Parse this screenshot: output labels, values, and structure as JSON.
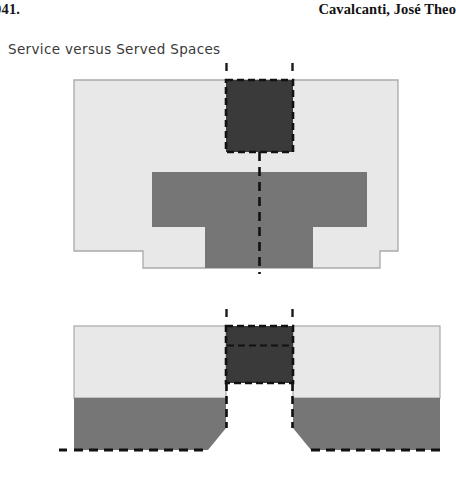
{
  "page": {
    "background_color": "#ffffff",
    "width": 454,
    "height": 496
  },
  "running_head": {
    "left_text": "041.",
    "right_text": "Cavalcanti, José Theo"
  },
  "figure": {
    "caption": "Service versus Served Spaces",
    "palette": {
      "light_gray": "#e8e8e8",
      "mid_gray": "#767676",
      "dark_gray": "#3a3a3a",
      "outline": "#9a9a9a",
      "dash_color": "#111111",
      "paper": "#ffffff"
    },
    "diagrams": [
      {
        "name": "plan-view",
        "description": "Upper plan: light gray served-space field with notched lower corners, a mid-gray cruciform served zone, and a dark dashed service block at top center bisected by a dashed center axis.",
        "regions": [
          {
            "name": "served-field",
            "fill": "#e8e8e8"
          },
          {
            "name": "served-core",
            "fill": "#767676"
          },
          {
            "name": "service-block",
            "fill": "#3a3a3a",
            "border": "dashed"
          }
        ],
        "axis": "vertical dashed center line",
        "tick_marks": 2
      },
      {
        "name": "section-view",
        "description": "Lower section: light gray upper band over mid-gray lower band, split at center by a dark dashed service shaft above a flared white void, with a dashed ground line at the base.",
        "regions": [
          {
            "name": "upper-band",
            "fill": "#e8e8e8"
          },
          {
            "name": "lower-band",
            "fill": "#767676"
          },
          {
            "name": "service-shaft",
            "fill": "#3a3a3a",
            "border": "dashed"
          },
          {
            "name": "void",
            "fill": "#ffffff"
          }
        ],
        "axis": "dashed ground line",
        "tick_marks": 2
      }
    ]
  }
}
